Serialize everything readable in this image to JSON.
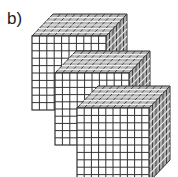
{
  "label": "b)",
  "colors": {
    "line": "#333333",
    "face": "#ffffff",
    "top": "#b8b8b8",
    "side": "#a8a8a8"
  },
  "cubes": [
    {
      "name": "cube-back",
      "x": 32,
      "y": 36,
      "w": 74,
      "h": 74,
      "dx": 21,
      "dy": 22,
      "cols": 10,
      "rows": 10,
      "depth": 6
    },
    {
      "name": "cube-middle",
      "x": 55,
      "y": 73,
      "w": 74,
      "h": 72,
      "dx": 21,
      "dy": 22,
      "cols": 10,
      "rows": 10,
      "depth": 6
    },
    {
      "name": "cube-front",
      "x": 77,
      "y": 108,
      "w": 72,
      "h": 74,
      "dx": 21,
      "dy": 22,
      "cols": 10,
      "rows": 10,
      "depth": 6
    }
  ]
}
